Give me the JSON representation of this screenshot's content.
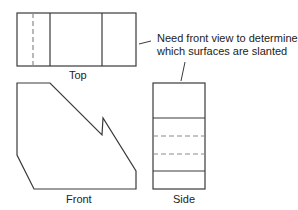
{
  "labels": {
    "top": "Top",
    "front": "Front",
    "side": "Side"
  },
  "annotation": {
    "line1": "Need front view to determine",
    "line2": "which surfaces are slanted"
  },
  "colors": {
    "line": "#3a3a3a",
    "hidden_line": "#8a8a8a",
    "text": "#222222",
    "background": "#ffffff"
  }
}
